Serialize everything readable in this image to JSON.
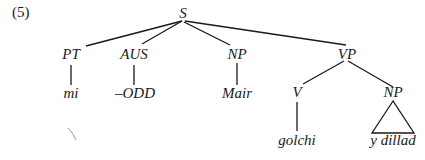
{
  "example_number": "(5)",
  "tree": {
    "root": "S",
    "nodes": {
      "s": {
        "label": "S"
      },
      "pt": {
        "label": "PT"
      },
      "aus": {
        "label": "AUS"
      },
      "np1": {
        "label": "NP"
      },
      "vp": {
        "label": "VP"
      },
      "mi": {
        "label": "mi"
      },
      "odd": {
        "label": "–ODD"
      },
      "mair": {
        "label": "Mair"
      },
      "v": {
        "label": "V"
      },
      "np2": {
        "label": "NP"
      },
      "golchi": {
        "label": "golchi"
      },
      "ydillad": {
        "label": "y dillad"
      }
    },
    "edges": [
      [
        "S",
        "PT"
      ],
      [
        "S",
        "AUS"
      ],
      [
        "S",
        "NP"
      ],
      [
        "S",
        "VP"
      ],
      [
        "PT",
        "mi"
      ],
      [
        "AUS",
        "–ODD"
      ],
      [
        "NP",
        "Mair"
      ],
      [
        "VP",
        "V"
      ],
      [
        "VP",
        "NP"
      ],
      [
        "V",
        "golchi"
      ],
      [
        "NP",
        "y dillad (triangle)"
      ]
    ]
  }
}
